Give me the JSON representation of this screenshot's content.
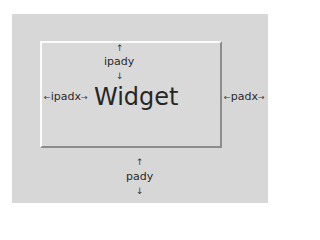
{
  "diagram": {
    "widget_label": "Widget",
    "ipady_label": "ipady",
    "ipadx_label": "ipadx",
    "padx_label": "padx",
    "pady_label": "pady",
    "arrow_up": "↑",
    "arrow_down": "↓",
    "arrow_left": "←",
    "arrow_right": "→",
    "colors": {
      "outer_bg": "#d7d7d7",
      "widget_bg": "#d9d9d9",
      "highlight": "#fbfbfb",
      "shadow": "#8c8c8c",
      "text": "#262626"
    }
  }
}
